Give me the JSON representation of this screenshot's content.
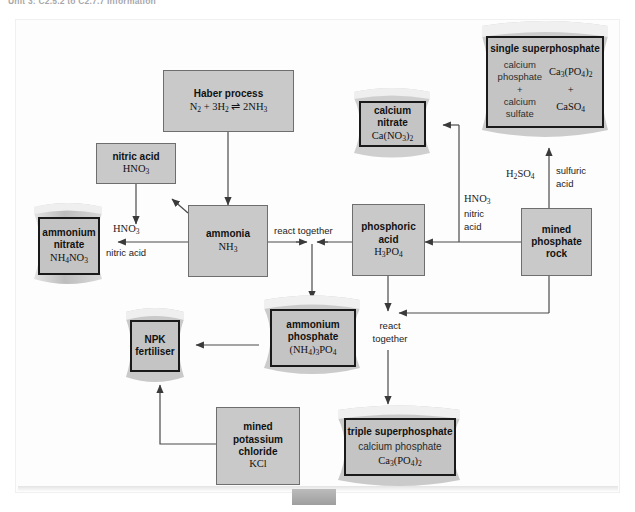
{
  "page": {
    "header": "Unit 3: C2.5.2 to C2.7.7 Information"
  },
  "diagram": {
    "type": "process-flow",
    "nodes": [
      {
        "id": "haber",
        "shape": "box",
        "line1": "Haber process",
        "line2": "N2 + 3H2 ⇌ 2NH3"
      },
      {
        "id": "nitric",
        "shape": "box",
        "line1": "nitric acid",
        "line2": "HNO3"
      },
      {
        "id": "ammonia",
        "shape": "box",
        "line1": "ammonia",
        "line2": "NH3"
      },
      {
        "id": "phosphoric",
        "shape": "box",
        "line1": "phosphoric",
        "line1b": "acid",
        "line2": "H3PO4"
      },
      {
        "id": "minedrock",
        "shape": "box",
        "line1": "mined",
        "line1b": "phosphate",
        "line1c": "rock"
      },
      {
        "id": "kcl",
        "shape": "box",
        "line1": "mined",
        "line1b": "potassium",
        "line1c": "chloride",
        "line2": "KCl"
      },
      {
        "id": "amnitrate",
        "shape": "bag",
        "line1": "ammonium",
        "line1b": "nitrate",
        "line2": "NH4NO3"
      },
      {
        "id": "canitrate",
        "shape": "bag",
        "line1": "calcium nitrate",
        "line2": "Ca(NO3)2"
      },
      {
        "id": "singlesuper",
        "shape": "bag",
        "line1": "single superphosphate",
        "left_col": [
          "calcium",
          "phosphate",
          "+",
          "calcium",
          "sulfate"
        ],
        "right_col": [
          "Ca3(PO4)2",
          "+",
          "CaSO4"
        ]
      },
      {
        "id": "amphosphate",
        "shape": "bag",
        "line1": "ammonium",
        "line1b": "phosphate",
        "line2": "(NH4)3PO4"
      },
      {
        "id": "npk",
        "shape": "bag",
        "line1": "NPK",
        "line1b": "fertiliser"
      },
      {
        "id": "triplesuper",
        "shape": "bag",
        "line1": "triple superphosphate",
        "line2": "calcium phosphate",
        "line3": "Ca3(PO4)2"
      }
    ],
    "edge_labels": [
      {
        "id": "hno3-left",
        "text": "HNO3"
      },
      {
        "id": "nitricacid-left",
        "text": "nitric acid"
      },
      {
        "id": "react-top",
        "text": "react together"
      },
      {
        "id": "react-bottom-1",
        "text": "react"
      },
      {
        "id": "react-bottom-2",
        "text": "together"
      },
      {
        "id": "hno3-right-1",
        "text": "HNO3"
      },
      {
        "id": "hno3-right-2",
        "text": "nitric"
      },
      {
        "id": "hno3-right-3",
        "text": "acid"
      },
      {
        "id": "h2so4",
        "text": "H2SO4"
      },
      {
        "id": "sulfuric-1",
        "text": "sulfuric"
      },
      {
        "id": "sulfuric-2",
        "text": "acid"
      }
    ]
  }
}
